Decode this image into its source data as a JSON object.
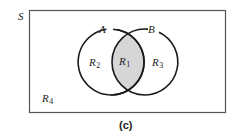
{
  "figure": {
    "universe_label": "S",
    "set_a_label": "A",
    "set_b_label": "B",
    "regions": [
      {
        "id": "R1",
        "base": "R",
        "sub": "1",
        "description": "A ∩ B (shaded)"
      },
      {
        "id": "R2",
        "base": "R",
        "sub": "2",
        "description": "A only"
      },
      {
        "id": "R3",
        "base": "R",
        "sub": "3",
        "description": "B only"
      },
      {
        "id": "R4",
        "base": "R",
        "sub": "4",
        "description": "outside A and B"
      }
    ],
    "caption": "(c)",
    "colors": {
      "stroke": "#1a1a1a",
      "rect_stroke": "#555555",
      "shade": "#d6d6d6",
      "background": "#ffffff"
    }
  }
}
